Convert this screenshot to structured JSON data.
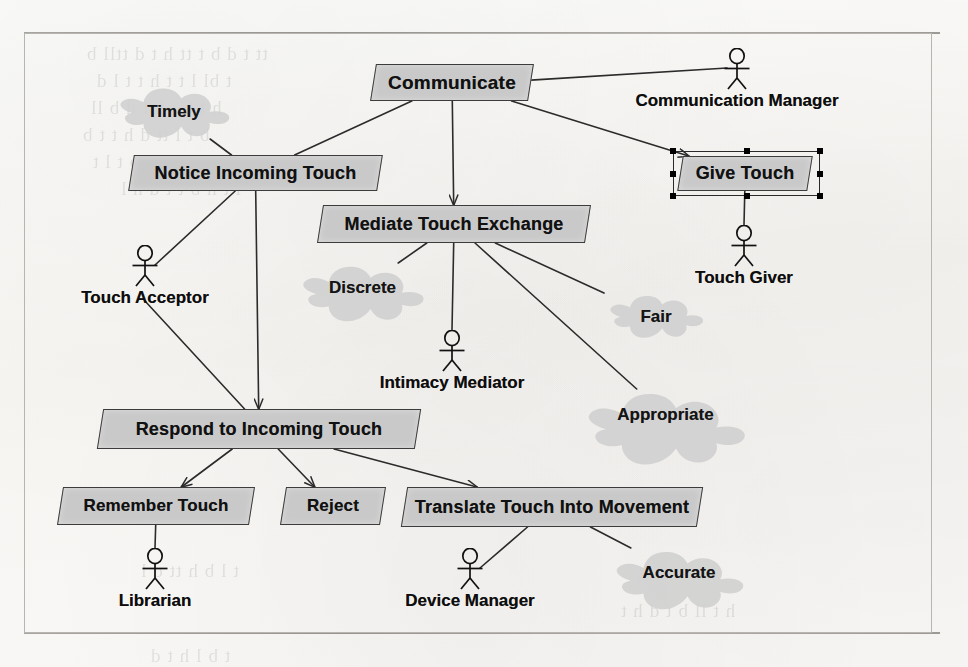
{
  "diagram": {
    "type": "uml-use-case-diagram",
    "frame": {
      "x": 24,
      "y": 33,
      "width": 908,
      "height": 600
    },
    "colors": {
      "node_fill": "#c9c9c9",
      "node_stroke": "#3c3c3c",
      "softgoal_fill": "#cfcfcf",
      "edge": "#2b2b2b",
      "paper": "#fbfaf8",
      "text": "#111111"
    }
  },
  "nodes": [
    {
      "id": "communicate",
      "label": "Communicate",
      "x": 373,
      "y": 64,
      "w": 158,
      "h": 37,
      "font": 19,
      "selected": false
    },
    {
      "id": "notice",
      "label": "Notice Incoming Touch",
      "x": 131,
      "y": 155,
      "w": 249,
      "h": 36,
      "font": 18,
      "selected": false
    },
    {
      "id": "give",
      "label": "Give Touch",
      "x": 680,
      "y": 156,
      "w": 130,
      "h": 35,
      "font": 18,
      "selected": true
    },
    {
      "id": "mediate",
      "label": "Mediate Touch Exchange",
      "x": 320,
      "y": 205,
      "w": 268,
      "h": 38,
      "font": 18,
      "selected": false
    },
    {
      "id": "respond",
      "label": "Respond to Incoming Touch",
      "x": 100,
      "y": 409,
      "w": 318,
      "h": 40,
      "font": 18,
      "selected": false
    },
    {
      "id": "remember",
      "label": "Remember Touch",
      "x": 60,
      "y": 487,
      "w": 192,
      "h": 38,
      "font": 17,
      "selected": false
    },
    {
      "id": "reject",
      "label": "Reject",
      "x": 283,
      "y": 487,
      "w": 100,
      "h": 38,
      "font": 17,
      "selected": false
    },
    {
      "id": "translate",
      "label": "Translate Touch Into Movement",
      "x": 404,
      "y": 487,
      "w": 296,
      "h": 40,
      "font": 18,
      "selected": false
    }
  ],
  "softgoals": [
    {
      "id": "timely",
      "label": "Timely",
      "x": 113,
      "y": 85,
      "w": 122,
      "h": 54,
      "font": 17
    },
    {
      "id": "discrete",
      "label": "Discrete",
      "x": 295,
      "y": 263,
      "w": 135,
      "h": 50,
      "font": 17
    },
    {
      "id": "fair",
      "label": "Fair",
      "x": 604,
      "y": 293,
      "w": 104,
      "h": 48,
      "font": 17
    },
    {
      "id": "appropriate",
      "label": "Appropriate",
      "x": 578,
      "y": 389,
      "w": 175,
      "h": 52,
      "font": 17
    },
    {
      "id": "accurate",
      "label": "Accurate",
      "x": 608,
      "y": 548,
      "w": 142,
      "h": 50,
      "font": 17
    }
  ],
  "actors": [
    {
      "id": "communication-manager",
      "label": "Communication Manager",
      "x": 737,
      "y": 48,
      "font": 17
    },
    {
      "id": "touch-giver",
      "label": "Touch Giver",
      "x": 744,
      "y": 225,
      "font": 17
    },
    {
      "id": "touch-acceptor",
      "label": "Touch Acceptor",
      "x": 145,
      "y": 245,
      "font": 17
    },
    {
      "id": "intimacy-mediator",
      "label": "Intimacy Mediator",
      "x": 452,
      "y": 330,
      "font": 17
    },
    {
      "id": "librarian",
      "label": "Librarian",
      "x": 155,
      "y": 548,
      "font": 17
    },
    {
      "id": "device-manager",
      "label": "Device Manager",
      "x": 470,
      "y": 548,
      "font": 17
    }
  ],
  "edges": [
    {
      "from": "communicate",
      "to": "notice",
      "arrow": "none",
      "kind": "decomposition"
    },
    {
      "from": "communicate",
      "to": "mediate",
      "arrow": "end",
      "kind": "decomposition"
    },
    {
      "from": "communicate",
      "to": "give",
      "arrow": "end",
      "kind": "decomposition"
    },
    {
      "from": "communicate",
      "to": "communication-manager",
      "arrow": "none",
      "kind": "association"
    },
    {
      "from": "notice",
      "to": "timely",
      "arrow": "none",
      "kind": "softgoal-link"
    },
    {
      "from": "notice",
      "to": "touch-acceptor",
      "arrow": "none",
      "kind": "association"
    },
    {
      "from": "notice",
      "to": "respond",
      "arrow": "end",
      "kind": "decomposition"
    },
    {
      "from": "touch-acceptor",
      "to": "respond",
      "arrow": "none",
      "kind": "association"
    },
    {
      "from": "mediate",
      "to": "discrete",
      "arrow": "none",
      "kind": "softgoal-link"
    },
    {
      "from": "mediate",
      "to": "intimacy-mediator",
      "arrow": "none",
      "kind": "association"
    },
    {
      "from": "mediate",
      "to": "fair",
      "arrow": "none",
      "kind": "softgoal-link"
    },
    {
      "from": "mediate",
      "to": "appropriate",
      "arrow": "none",
      "kind": "softgoal-link"
    },
    {
      "from": "give",
      "to": "touch-giver",
      "arrow": "none",
      "kind": "association"
    },
    {
      "from": "respond",
      "to": "remember",
      "arrow": "end",
      "kind": "decomposition"
    },
    {
      "from": "respond",
      "to": "reject",
      "arrow": "end",
      "kind": "decomposition"
    },
    {
      "from": "respond",
      "to": "translate",
      "arrow": "end",
      "kind": "decomposition"
    },
    {
      "from": "remember",
      "to": "librarian",
      "arrow": "none",
      "kind": "association"
    },
    {
      "from": "translate",
      "to": "device-manager",
      "arrow": "none",
      "kind": "association"
    },
    {
      "from": "translate",
      "to": "accurate",
      "arrow": "none",
      "kind": "softgoal-link"
    }
  ],
  "selection": {
    "node_id": "give",
    "handle_count": 8,
    "box": {
      "x": 673,
      "y": 151,
      "width": 147,
      "height": 45
    }
  },
  "background_bleed": [
    {
      "text": "tt t d b  t tt  h   t  d ttll  b",
      "x": 86,
      "y": 43,
      "size": 19,
      "rot": 0
    },
    {
      "text": "t  bl  l  t t  h   t t  l  d",
      "x": 96,
      "y": 70,
      "size": 19,
      "rot": 0
    },
    {
      "text": "h t  b  t  h  t  d  b  ll",
      "x": 90,
      "y": 97,
      "size": 19,
      "rot": 0
    },
    {
      "text": "b t   l tt  d  h   t t  b",
      "x": 82,
      "y": 124,
      "size": 19,
      "rot": 0
    },
    {
      "text": "t  h  lt  d  t  b t  l  t",
      "x": 92,
      "y": 151,
      "size": 19,
      "rot": 0
    },
    {
      "text": "l  t h  b t t  d   h l",
      "x": 120,
      "y": 178,
      "size": 19,
      "rot": 0
    },
    {
      "text": "d  t  h t  b  ll  t",
      "x": 110,
      "y": 430,
      "size": 19,
      "rot": 0
    },
    {
      "text": "t l  b  h tt  d  l",
      "x": 140,
      "y": 560,
      "size": 19,
      "rot": 0
    },
    {
      "text": "h  t  ll  b t  d h  t",
      "x": 620,
      "y": 600,
      "size": 19,
      "rot": 0
    },
    {
      "text": "t  b  l h t  d",
      "x": 150,
      "y": 645,
      "size": 19,
      "rot": 0
    }
  ]
}
